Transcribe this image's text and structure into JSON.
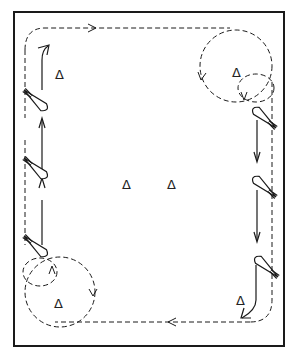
{
  "diagram": {
    "type": "drill-pattern",
    "border": {
      "x": 14,
      "y": 12,
      "w": 123,
      "h": 155
    },
    "colors": {
      "line": "#1a1a1a",
      "background": "#ffffff"
    },
    "cone_symbol": "Δ",
    "cones": [
      {
        "id": "cone-top-left",
        "x": 61,
        "y": 74,
        "label": "Δ"
      },
      {
        "id": "cone-top-right",
        "x": 238,
        "y": 72,
        "label": "Δ"
      },
      {
        "id": "cone-center-left",
        "x": 128,
        "y": 184,
        "label": "Δ"
      },
      {
        "id": "cone-center-right",
        "x": 173,
        "y": 184,
        "label": "Δ"
      },
      {
        "id": "cone-bottom-left",
        "x": 60,
        "y": 303,
        "label": "Δ"
      },
      {
        "id": "cone-bottom-right",
        "x": 243,
        "y": 304,
        "label": "Δ"
      }
    ],
    "path_description": "Dashed clockwise loop around field with circles around corner cones; skiers on left moving up, on right moving down"
  },
  "labels": {
    "title": "Drill pattern diagram"
  }
}
